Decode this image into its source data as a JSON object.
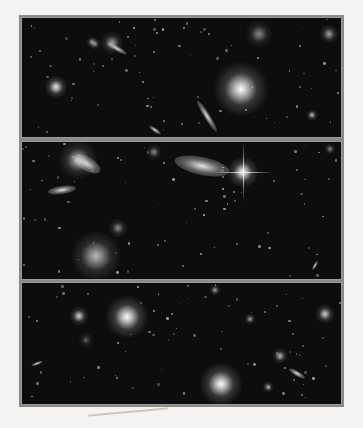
{
  "image": {
    "description": "Scanned deep-field astronomical photograph in three stacked panels showing galaxies and stars",
    "panels": [
      {
        "id": "top",
        "features": [
          "bright elliptical galaxy right of center",
          "compact galaxy at left",
          "edge-on elongated galaxy near bottom center",
          "scattered faint galaxies"
        ],
        "objects": [
          {
            "x": 219,
            "y": 71,
            "r": 14,
            "glow": 1.0
          },
          {
            "x": 34,
            "y": 69,
            "r": 6,
            "glow": 0.9
          },
          {
            "x": 90,
            "y": 25,
            "r": 6,
            "glow": 0.6
          },
          {
            "x": 237,
            "y": 16,
            "r": 7,
            "glow": 0.5
          },
          {
            "x": 307,
            "y": 16,
            "r": 5,
            "glow": 0.6
          },
          {
            "x": 290,
            "y": 97,
            "r": 3,
            "glow": 0.7
          },
          {
            "x": 70,
            "y": 24,
            "r": 3,
            "glow": 0.6
          },
          {
            "x": 73,
            "y": 26,
            "r": 3,
            "glow": 0.5
          }
        ],
        "elongated": [
          {
            "x": 185,
            "y": 98,
            "w": 36,
            "h": 6,
            "angle": 58
          },
          {
            "x": 95,
            "y": 30,
            "w": 22,
            "h": 5,
            "angle": 30
          },
          {
            "x": 133,
            "y": 112,
            "w": 14,
            "h": 4,
            "angle": 35
          }
        ]
      },
      {
        "id": "middle",
        "features": [
          "large inclined spiral galaxy center",
          "bright diffraction-spiked star right of center",
          "spiral galaxies upper-left and lower-left"
        ],
        "objects": [
          {
            "x": 221,
            "y": 30,
            "r": 8,
            "glow": 1.0,
            "spikes": true
          },
          {
            "x": 56,
            "y": 18,
            "r": 10,
            "glow": 0.7
          },
          {
            "x": 74,
            "y": 114,
            "r": 13,
            "glow": 0.7
          },
          {
            "x": 96,
            "y": 86,
            "r": 5,
            "glow": 0.5
          },
          {
            "x": 132,
            "y": 10,
            "r": 4,
            "glow": 0.5
          },
          {
            "x": 308,
            "y": 7,
            "r": 3,
            "glow": 0.5
          }
        ],
        "elongated": [
          {
            "x": 180,
            "y": 24,
            "w": 56,
            "h": 18,
            "angle": 12
          },
          {
            "x": 40,
            "y": 48,
            "w": 28,
            "h": 8,
            "angle": -8
          },
          {
            "x": 65,
            "y": 22,
            "w": 30,
            "h": 14,
            "angle": 30
          },
          {
            "x": 293,
            "y": 123,
            "w": 10,
            "h": 3,
            "angle": -60
          }
        ]
      },
      {
        "id": "bottom",
        "features": [
          "bright compact elliptical upper-left",
          "bright elliptical with halo lower-center",
          "galaxy group lower-right"
        ],
        "objects": [
          {
            "x": 105,
            "y": 34,
            "r": 11,
            "glow": 1.0
          },
          {
            "x": 199,
            "y": 101,
            "r": 11,
            "glow": 1.0
          },
          {
            "x": 57,
            "y": 33,
            "r": 5,
            "glow": 0.8
          },
          {
            "x": 303,
            "y": 31,
            "r": 5,
            "glow": 0.8
          },
          {
            "x": 258,
            "y": 73,
            "r": 4,
            "glow": 0.7
          },
          {
            "x": 228,
            "y": 36,
            "r": 3,
            "glow": 0.6
          },
          {
            "x": 193,
            "y": 7,
            "r": 3,
            "glow": 0.6
          },
          {
            "x": 64,
            "y": 57,
            "r": 4,
            "glow": 0.3
          },
          {
            "x": 246,
            "y": 104,
            "r": 3,
            "glow": 0.6
          }
        ],
        "elongated": [
          {
            "x": 275,
            "y": 90,
            "w": 18,
            "h": 5,
            "angle": 30
          },
          {
            "x": 15,
            "y": 80,
            "w": 12,
            "h": 3,
            "angle": -20
          }
        ]
      }
    ]
  }
}
